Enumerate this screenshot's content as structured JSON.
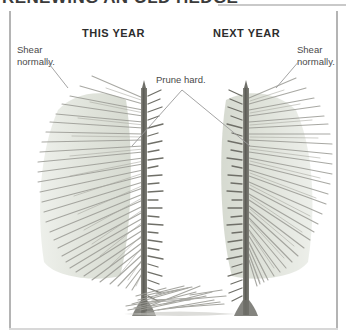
{
  "figure": {
    "title": "RENEWING AN OLD HEDGE",
    "background_color": "#ffffff",
    "frame_color": "#b4b4b4"
  },
  "headings": {
    "this_year": "THIS YEAR",
    "next_year": "NEXT YEAR"
  },
  "callouts": {
    "left": "Shear\nnormally.",
    "left_line1": "Shear",
    "left_line2": "normally.",
    "right_line1": "Shear",
    "right_line2": "normally.",
    "center": "Prune hard."
  },
  "illustration": {
    "type": "botanical-pencil-drawing",
    "subject": "hedge-renewal-pruning-diagram",
    "panels": [
      {
        "name": "this-year",
        "trunk_x": 145,
        "trunk_top": 88,
        "trunk_bottom": 315,
        "foliage_side": "left",
        "foliage_color": "#c9cfc2",
        "twig_color": "#8a8a85",
        "trunk_color": "#6e6e68",
        "description": "Hedge shrub with cut-back side facing the gap; remaining foliage on outer (left) face sheared normally."
      },
      {
        "name": "next-year",
        "trunk_x": 245,
        "trunk_top": 88,
        "trunk_bottom": 315,
        "foliage_side": "right",
        "foliage_color": "#c9cfc2",
        "twig_color": "#8a8a85",
        "trunk_color": "#6e6e68",
        "description": "Second hedge shrub, mirrored; outer (right) face retains foliage."
      }
    ],
    "ground_debris": {
      "name": "pruned-branch-pile",
      "x": 130,
      "y": 285,
      "width": 110,
      "height": 30,
      "color": "#a8a8a2"
    },
    "leader_lines": {
      "center_apex": [
        182,
        90
      ],
      "center_left_end": [
        140,
        140
      ],
      "center_right_end": [
        232,
        140
      ],
      "left_label_end": [
        68,
        86
      ],
      "right_label_end": [
        278,
        86
      ],
      "color": "#9a9a9a"
    }
  }
}
